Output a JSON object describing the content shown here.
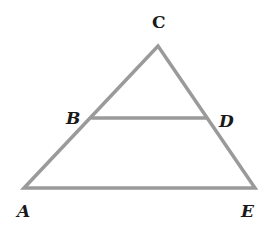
{
  "diagram": {
    "type": "triangle-with-parallel-segment",
    "line_color": "#9a9a9a",
    "label_color": "#1a1a1a",
    "points": {
      "A": {
        "label": "A",
        "x": 24,
        "y": 188
      },
      "B": {
        "label": "B",
        "x": 92,
        "y": 118
      },
      "C": {
        "label": "C",
        "x": 158,
        "y": 46
      },
      "D": {
        "label": "D",
        "x": 206,
        "y": 118
      },
      "E": {
        "label": "E",
        "x": 255,
        "y": 188
      }
    },
    "segments": [
      {
        "from": "A",
        "to": "C"
      },
      {
        "from": "C",
        "to": "E"
      },
      {
        "from": "A",
        "to": "E"
      },
      {
        "from": "B",
        "to": "D"
      }
    ],
    "labels": {
      "A": "A",
      "B": "B",
      "C": "C",
      "D": "D",
      "E": "E"
    }
  }
}
